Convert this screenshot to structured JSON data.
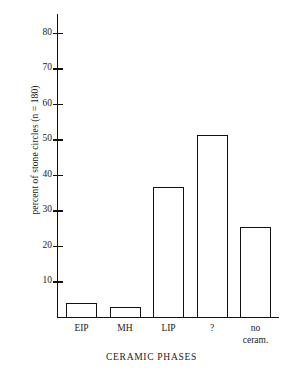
{
  "chart_data": {
    "type": "bar",
    "title": "",
    "xlabel": "CERAMIC PHASES",
    "ylabel": "percent of stone circles (n = 180)",
    "categories": [
      "EIP",
      "MH",
      "LIP",
      "?",
      "no\nceram."
    ],
    "values": [
      4,
      3,
      36.6,
      51.3,
      25.3
    ],
    "ylim": [
      0,
      85
    ],
    "yticks": [
      10,
      20,
      30,
      40,
      50,
      60,
      70,
      80
    ],
    "ytick_labels": [
      "10",
      "20",
      "30",
      "40",
      "50",
      "60",
      "70",
      "80"
    ],
    "grid": false,
    "legend": null,
    "n": 180
  },
  "axis": {
    "y_label": "percent of stone circles (n = 180)",
    "x_title": "CERAMIC PHASES",
    "tick_labels": [
      "80",
      "70",
      "60",
      "50",
      "40",
      "30",
      "20",
      "10"
    ]
  },
  "bars": [
    {
      "label": "EIP",
      "value": 4
    },
    {
      "label": "MH",
      "value": 3
    },
    {
      "label": "LIP",
      "value": 36.6
    },
    {
      "label": "?",
      "value": 51.3
    },
    {
      "label": "no\nceram.",
      "value": 25.3
    }
  ],
  "colors": {
    "ink": "#111111",
    "background": "#ffffff",
    "bar_fill": "#ffffff"
  }
}
